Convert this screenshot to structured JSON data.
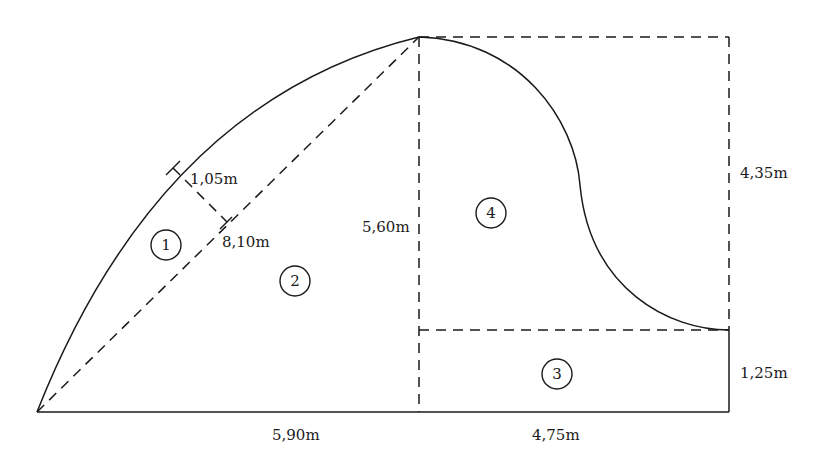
{
  "diagram": {
    "type": "composite-area-figure",
    "regions": [
      {
        "id": "1",
        "label": "1",
        "shape": "circular segment"
      },
      {
        "id": "2",
        "label": "2",
        "shape": "triangle"
      },
      {
        "id": "3",
        "label": "3",
        "shape": "rectangle"
      },
      {
        "id": "4",
        "label": "4",
        "shape": "rectangle minus S-curve"
      }
    ],
    "dimensions": {
      "segment_height": "1,05m",
      "chord": "8,10m",
      "triangle_height": "5,60m",
      "triangle_base": "5,90m",
      "rect_width": "4,75m",
      "upper_height": "4,35m",
      "lower_height": "1,25m"
    }
  }
}
